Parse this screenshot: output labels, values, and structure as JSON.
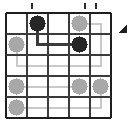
{
  "figure": {
    "type": "grid",
    "rows": 5,
    "cols": 5,
    "grid_origin_x": 6,
    "grid_origin_y": 13,
    "cell_size": 21,
    "colors": {
      "background": "#ffffff",
      "grid_line": "#3a3a3a",
      "grid_border": "#1e1e1e",
      "token_dark": "#262626",
      "token_light": "#a8a8a8",
      "path_dark": "#3a3a3a",
      "path_light": "#c9c9c9",
      "tick_mark": "#2b2b2b",
      "arrow": "#1e1e1e"
    }
  },
  "chart_data": {
    "type": "heatmap",
    "xlabel": "",
    "ylabel": "",
    "categories": [
      "c1",
      "c2",
      "c3",
      "c4",
      "c5"
    ],
    "rows": [
      "r1",
      "r2",
      "r3",
      "r4",
      "r5"
    ],
    "tokens": [
      {
        "id": "t1",
        "row": 1,
        "col": 2,
        "color": "dark",
        "label": ""
      },
      {
        "id": "t2",
        "row": 1,
        "col": 4,
        "color": "light",
        "label": ""
      },
      {
        "id": "t3",
        "row": 2,
        "col": 1,
        "color": "light",
        "label": ""
      },
      {
        "id": "t4",
        "row": 2,
        "col": 4,
        "color": "dark",
        "label": ""
      },
      {
        "id": "t5",
        "row": 4,
        "col": 1,
        "color": "light",
        "label": ""
      },
      {
        "id": "t6",
        "row": 4,
        "col": 4,
        "color": "light",
        "label": ""
      },
      {
        "id": "t7",
        "row": 4,
        "col": 5,
        "color": "light",
        "label": ""
      },
      {
        "id": "t8",
        "row": 5,
        "col": 1,
        "color": "light",
        "label": ""
      }
    ],
    "paths": [
      {
        "id": "p1",
        "color": "dark",
        "points": [
          [
            2,
            1
          ],
          [
            2,
            2
          ],
          [
            4,
            2
          ]
        ]
      },
      {
        "id": "p2",
        "color": "light",
        "points": [
          [
            4,
            1
          ],
          [
            5,
            1
          ],
          [
            5,
            3
          ],
          [
            1,
            3
          ],
          [
            1,
            2
          ]
        ]
      },
      {
        "id": "p3",
        "color": "light",
        "points": [
          [
            1,
            4
          ],
          [
            4,
            4
          ]
        ]
      },
      {
        "id": "p4",
        "color": "light",
        "points": [
          [
            1,
            5
          ],
          [
            5,
            5
          ],
          [
            5,
            4
          ]
        ]
      }
    ],
    "tick_marks": [
      {
        "id": "tick1",
        "x": 31,
        "y": 3
      },
      {
        "id": "tick2",
        "x": 84,
        "y": 3
      },
      {
        "id": "tick3",
        "x": 95,
        "y": 3
      }
    ],
    "arrow": {
      "id": "arrow1",
      "x": 118,
      "y": 33,
      "direction": "up-right"
    },
    "legend": [],
    "grid": true
  }
}
